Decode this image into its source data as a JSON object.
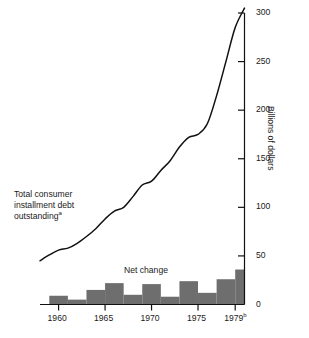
{
  "chart_data": {
    "type": "line",
    "title": "",
    "subtitle": "",
    "xlabel": "",
    "ylabel": "Billions of dollars",
    "ylim": [
      0,
      300
    ],
    "xlim": [
      1958,
      1980
    ],
    "grid": false,
    "legend_position": "inline-annotations",
    "y_ticks": [
      0,
      50,
      100,
      150,
      200,
      250,
      300
    ],
    "y_tick_labels": [
      "0",
      "50",
      "100",
      "150",
      "200",
      "250",
      "300"
    ],
    "x_ticks": [
      1960,
      1965,
      1970,
      1975,
      1979
    ],
    "x_tick_labels": [
      "1960",
      "1965",
      "1970",
      "1975",
      "1979"
    ],
    "x_tick_label_superscripts": [
      "",
      "",
      "",
      "",
      "b"
    ],
    "annotations": [
      {
        "name": "total-consumer-installment-debt",
        "lines": [
          "Total consumer",
          "installment debt",
          "outstanding"
        ],
        "superscript": "a",
        "x": 1959,
        "y": 115
      },
      {
        "name": "net-change",
        "text": "Net change",
        "x": 1971,
        "y": 58
      }
    ],
    "series": [
      {
        "name": "Total consumer installment debt outstanding",
        "type": "line",
        "color": "#111111",
        "x": [
          1958,
          1959,
          1960,
          1961,
          1962,
          1963,
          1964,
          1965,
          1966,
          1967,
          1968,
          1969,
          1970,
          1971,
          1972,
          1973,
          1974,
          1975,
          1976,
          1977,
          1978,
          1979,
          1980
        ],
        "values": [
          45,
          51,
          56,
          58,
          63,
          70,
          78,
          88,
          96,
          100,
          111,
          123,
          127,
          138,
          148,
          162,
          172,
          175,
          186,
          215,
          250,
          285,
          305
        ]
      },
      {
        "name": "Net change",
        "type": "bar",
        "color": "#6e6e6e",
        "x": [
          1959,
          1960,
          1961,
          1962,
          1963,
          1964,
          1965,
          1966,
          1967,
          1968,
          1969,
          1970,
          1971,
          1972,
          1973,
          1974,
          1975,
          1976,
          1977,
          1978,
          1979
        ],
        "values": [
          9,
          5,
          5,
          15,
          15,
          22,
          22,
          10,
          10,
          21,
          21,
          8,
          8,
          24,
          24,
          12,
          12,
          26,
          26,
          36,
          36
        ]
      }
    ]
  },
  "axes": {
    "y_axis_title": "Billions of dollars"
  }
}
